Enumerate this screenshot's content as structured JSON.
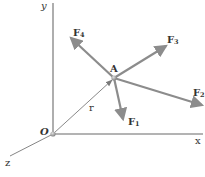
{
  "diagram": {
    "colors": {
      "axis": "#9a9a9a",
      "force_vector": "#8c8c8c",
      "position_vector": "#7a7a7a",
      "label": "#333333",
      "point": "#aaaaaa"
    },
    "axes": {
      "x": {
        "label": "x"
      },
      "y": {
        "label": "y"
      },
      "z": {
        "label": "z"
      },
      "origin": {
        "label": "O"
      }
    },
    "point": {
      "label": "A"
    },
    "position_vector": {
      "label": "r"
    },
    "forces": [
      {
        "name": "F",
        "sub": "1"
      },
      {
        "name": "F",
        "sub": "2"
      },
      {
        "name": "F",
        "sub": "3"
      },
      {
        "name": "F",
        "sub": "4"
      }
    ]
  }
}
